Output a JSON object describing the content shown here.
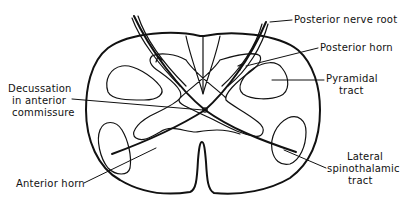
{
  "diagram": {
    "labels": {
      "posterior_nerve_root": "Posterior nerve root",
      "posterior_horn": "Posterior horn",
      "pyramidal_tract_1": "Pyramidal",
      "pyramidal_tract_2": "tract",
      "decussation_1": "Decussation",
      "decussation_2": "in anterior",
      "decussation_3": "commissure",
      "lateral_spinothalamic_1": "Lateral",
      "lateral_spinothalamic_2": "spinothalamic",
      "lateral_spinothalamic_3": "tract",
      "anterior_horn": "Anterior horn"
    },
    "colors": {
      "line": "#111111",
      "background": "#ffffff"
    }
  }
}
